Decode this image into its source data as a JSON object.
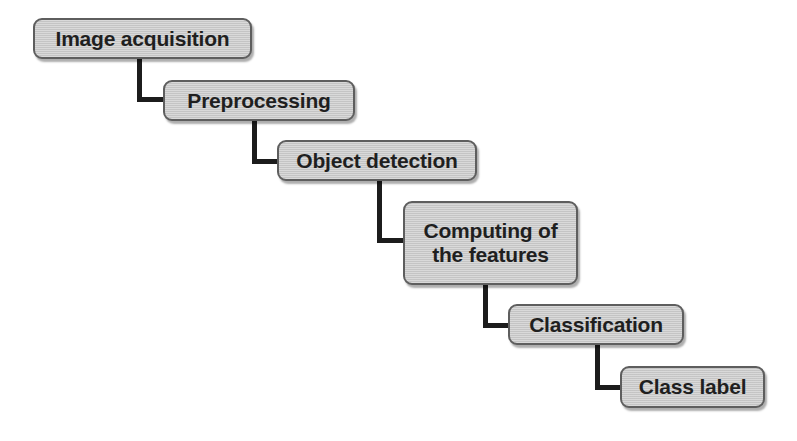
{
  "diagram": {
    "type": "flowchart",
    "orientation": "top-left-to-bottom-right cascade",
    "node_fill_color": "#c9c9c9",
    "node_border_color": "#5e5e5e",
    "connector_color": "#1c1c1c",
    "text_color": "#1f1f1f",
    "background_color": "#ffffff",
    "nodes": [
      {
        "id": "image-acquisition",
        "label": "Image acquisition"
      },
      {
        "id": "preprocessing",
        "label": "Preprocessing"
      },
      {
        "id": "object-detection",
        "label": "Object detection"
      },
      {
        "id": "computing-features",
        "label": "Computing of\nthe features"
      },
      {
        "id": "classification",
        "label": "Classification"
      },
      {
        "id": "class-label",
        "label": "Class label"
      }
    ],
    "edges": [
      {
        "from": "image-acquisition",
        "to": "preprocessing"
      },
      {
        "from": "preprocessing",
        "to": "object-detection"
      },
      {
        "from": "object-detection",
        "to": "computing-features"
      },
      {
        "from": "computing-features",
        "to": "classification"
      },
      {
        "from": "classification",
        "to": "class-label"
      }
    ]
  }
}
